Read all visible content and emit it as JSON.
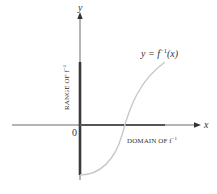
{
  "diagram": {
    "axes": {
      "x_label": "x",
      "y_label": "y",
      "origin_label": "0"
    },
    "curve_label": {
      "prefix": "y = f",
      "superscript": "−1",
      "suffix": "(x)"
    },
    "range_label": {
      "text": "RANGE OF f",
      "superscript": "−1"
    },
    "domain_label": {
      "text": "DOMAIN OF f",
      "superscript": "−1"
    },
    "colors": {
      "axis": "#333333",
      "highlight_segment": "#3a3a3a",
      "curve": "#c8c8c8",
      "text": "#333333"
    }
  }
}
